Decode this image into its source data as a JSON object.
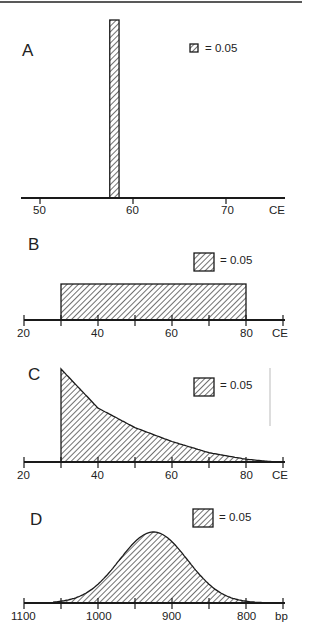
{
  "chart_data": [
    {
      "panel": "A",
      "type": "bar",
      "xlabel": "CE",
      "xlim": [
        48,
        76
      ],
      "ticks": [
        50,
        60,
        70
      ],
      "tick_labels": [
        "50",
        "60",
        "70"
      ],
      "bars": [
        {
          "x0": 57.5,
          "x1": 58.5,
          "height": 1.0
        }
      ],
      "legend": "= 0.05",
      "legend_box": "small"
    },
    {
      "panel": "B",
      "type": "bar",
      "xlabel": "CE",
      "xlim": [
        20,
        90
      ],
      "ticks": [
        20,
        30,
        40,
        50,
        60,
        70,
        80,
        90
      ],
      "tick_labels": [
        "20",
        "",
        "40",
        "",
        "60",
        "",
        "80",
        "CE"
      ],
      "bars": [
        {
          "x0": 30,
          "x1": 80,
          "height": 0.02
        }
      ],
      "legend": "= 0.05"
    },
    {
      "panel": "C",
      "type": "area",
      "xlabel": "CE",
      "xlim": [
        20,
        90
      ],
      "ticks": [
        20,
        30,
        40,
        50,
        60,
        70,
        80,
        90
      ],
      "tick_labels": [
        "20",
        "",
        "40",
        "",
        "60",
        "",
        "80",
        "CE"
      ],
      "distribution": "exponential-decay",
      "x": [
        30,
        40,
        50,
        60,
        70,
        80,
        88
      ],
      "y": [
        1.0,
        0.58,
        0.37,
        0.22,
        0.1,
        0.03,
        0.0
      ],
      "legend": "= 0.05"
    },
    {
      "panel": "D",
      "type": "area",
      "xlabel": "bp",
      "xlim": [
        1100,
        750
      ],
      "ticks": [
        1100,
        1050,
        1000,
        950,
        900,
        850,
        800,
        750
      ],
      "tick_labels": [
        "1100",
        "",
        "1000",
        "",
        "900",
        "",
        "800",
        "bp"
      ],
      "distribution": "gaussian",
      "mean": 925,
      "sd": 46,
      "range": [
        1060,
        770
      ],
      "legend": "= 0.05"
    }
  ],
  "panels": {
    "A": {
      "letter": "A",
      "legend": "= 0.05",
      "tick_labels": [
        "50",
        "60",
        "70"
      ],
      "unit": "CE"
    },
    "B": {
      "letter": "B",
      "legend": "= 0.05",
      "tick_labels": [
        "20",
        "40",
        "60",
        "80"
      ],
      "unit": "CE"
    },
    "C": {
      "letter": "C",
      "legend": "= 0.05",
      "tick_labels": [
        "20",
        "40",
        "60",
        "80"
      ],
      "unit": "CE"
    },
    "D": {
      "letter": "D",
      "legend": "= 0.05",
      "tick_labels": [
        "1100",
        "1000",
        "900",
        "800"
      ],
      "unit": "bp"
    }
  }
}
